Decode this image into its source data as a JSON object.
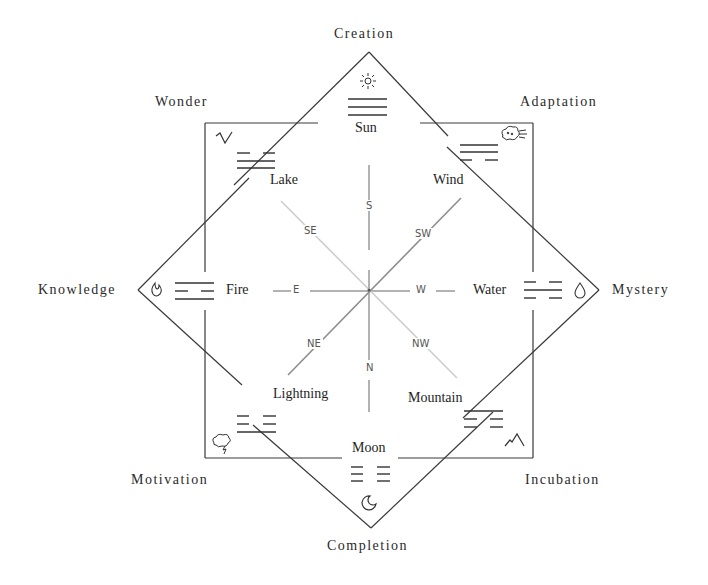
{
  "diagram": {
    "outer_labels": {
      "creation": "Creation",
      "adaptation": "Adaptation",
      "mystery": "Mystery",
      "incubation": "Incubation",
      "completion": "Completion",
      "motivation": "Motivation",
      "knowledge": "Knowledge",
      "wonder": "Wonder"
    },
    "trigrams": {
      "sun": {
        "name": "Sun",
        "lines": [
          "solid",
          "solid",
          "solid"
        ],
        "icon": "sun-icon"
      },
      "wind": {
        "name": "Wind",
        "lines": [
          "solid",
          "solid",
          "broken"
        ],
        "icon": "wind-cloud-icon"
      },
      "water": {
        "name": "Water",
        "lines": [
          "broken",
          "solid",
          "broken"
        ],
        "icon": "water-drop-icon"
      },
      "mountain": {
        "name": "Mountain",
        "lines": [
          "solid",
          "broken",
          "broken"
        ],
        "icon": "mountain-icon"
      },
      "moon": {
        "name": "Moon",
        "lines": [
          "broken",
          "broken",
          "broken"
        ],
        "icon": "crescent-moon-icon"
      },
      "lightning": {
        "name": "Lightning",
        "lines": [
          "broken",
          "broken",
          "solid"
        ],
        "icon": "thunder-cloud-icon"
      },
      "fire": {
        "name": "Fire",
        "lines": [
          "solid",
          "broken",
          "solid"
        ],
        "icon": "flame-icon"
      },
      "lake": {
        "name": "Lake",
        "lines": [
          "broken",
          "solid",
          "solid"
        ],
        "icon": "lake-wave-icon"
      }
    },
    "directions": {
      "s": "S",
      "sw": "SW",
      "w": "W",
      "nw": "NW",
      "n": "N",
      "ne": "NE",
      "e": "E",
      "se": "SE"
    },
    "colors": {
      "line": "#3a3a3a",
      "compass_axis": "#999999",
      "compass_diag_dark": "#8e8e8e",
      "compass_diag_light": "#cccccc",
      "background": "#ffffff"
    }
  }
}
